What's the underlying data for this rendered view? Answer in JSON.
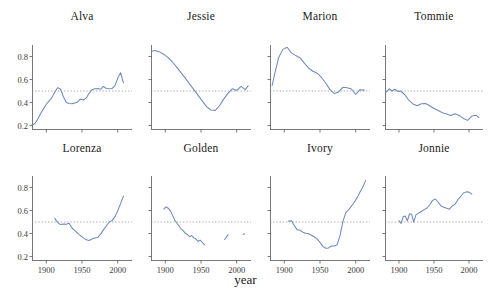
{
  "figure": {
    "xlabel": "year",
    "background": "#ffffff",
    "line_color": "#7089bd",
    "axis_color": "#555555",
    "reference_line_color": "#8c8c8c",
    "reference_line_value": 0.5
  },
  "chart_data": {
    "type": "line",
    "title": "",
    "xlabel": "year",
    "ylabel": "",
    "xlim": [
      1880,
      2020
    ],
    "ylim": [
      0.17,
      0.9
    ],
    "xticks": [
      1900,
      1950,
      2000
    ],
    "xtick_labels": [
      "1900",
      "1950",
      "2000"
    ],
    "yticks": [
      0.2,
      0.4,
      0.6,
      0.8
    ],
    "ytick_labels": [
      "0.2",
      "0.4",
      "0.6",
      "0.8"
    ],
    "grid": false,
    "legend": "none",
    "annotations": [
      {
        "type": "hline",
        "y": 0.5,
        "style": "dotted",
        "color": "#8c8c8c"
      }
    ],
    "facet_layout": {
      "rows": 2,
      "cols": 4
    },
    "facets": [
      {
        "name": "Alva",
        "row": 0,
        "col": 0,
        "ytick_labels_shown": true,
        "xtick_labels_shown": false,
        "x": [
          1880,
          1884,
          1888,
          1892,
          1896,
          1900,
          1904,
          1908,
          1912,
          1916,
          1920,
          1924,
          1928,
          1932,
          1936,
          1940,
          1944,
          1948,
          1952,
          1956,
          1960,
          1964,
          1968,
          1972,
          1976,
          1980,
          1984,
          1988,
          1992,
          1996,
          2000,
          2004,
          2008
        ],
        "y": [
          0.205,
          0.215,
          0.255,
          0.305,
          0.345,
          0.385,
          0.415,
          0.445,
          0.49,
          0.53,
          0.515,
          0.45,
          0.4,
          0.392,
          0.39,
          0.395,
          0.405,
          0.43,
          0.422,
          0.44,
          0.48,
          0.512,
          0.52,
          0.522,
          0.515,
          0.54,
          0.522,
          0.52,
          0.522,
          0.545,
          0.61,
          0.66,
          0.572
        ]
      },
      {
        "name": "Jessie",
        "row": 0,
        "col": 1,
        "ytick_labels_shown": false,
        "xtick_labels_shown": false,
        "x": [
          1881,
          1886,
          1892,
          1898,
          1904,
          1910,
          1916,
          1922,
          1928,
          1934,
          1940,
          1946,
          1952,
          1958,
          1964,
          1970,
          1976,
          1982,
          1988,
          1994,
          2000,
          2006,
          2012,
          2016
        ],
        "y": [
          0.845,
          0.852,
          0.84,
          0.818,
          0.79,
          0.752,
          0.708,
          0.66,
          0.612,
          0.562,
          0.512,
          0.462,
          0.412,
          0.362,
          0.335,
          0.332,
          0.372,
          0.432,
          0.482,
          0.52,
          0.505,
          0.54,
          0.512,
          0.545
        ]
      },
      {
        "name": "Marion",
        "row": 0,
        "col": 2,
        "ytick_labels_shown": false,
        "xtick_labels_shown": false,
        "x": [
          1883,
          1887,
          1892,
          1898,
          1904,
          1910,
          1916,
          1922,
          1928,
          1934,
          1940,
          1946,
          1952,
          1958,
          1964,
          1970,
          1976,
          1982,
          1988,
          1994,
          2000,
          2006,
          2012
        ],
        "y": [
          0.548,
          0.66,
          0.79,
          0.862,
          0.88,
          0.832,
          0.808,
          0.79,
          0.742,
          0.7,
          0.672,
          0.655,
          0.618,
          0.57,
          0.512,
          0.478,
          0.492,
          0.532,
          0.528,
          0.518,
          0.47,
          0.512,
          0.508
        ]
      },
      {
        "name": "Tommie",
        "row": 0,
        "col": 3,
        "ytick_labels_shown": false,
        "xtick_labels_shown": false,
        "x": [
          1882,
          1886,
          1890,
          1894,
          1898,
          1902,
          1908,
          1914,
          1920,
          1926,
          1932,
          1938,
          1944,
          1950,
          1956,
          1962,
          1968,
          1974,
          1980,
          1986,
          1992,
          1998,
          2004,
          2010,
          2014
        ],
        "y": [
          0.492,
          0.52,
          0.5,
          0.515,
          0.498,
          0.5,
          0.47,
          0.42,
          0.388,
          0.372,
          0.39,
          0.392,
          0.372,
          0.348,
          0.33,
          0.312,
          0.3,
          0.288,
          0.302,
          0.288,
          0.262,
          0.245,
          0.282,
          0.29,
          0.27
        ]
      },
      {
        "name": "Lorenza",
        "row": 1,
        "col": 0,
        "ytick_labels_shown": true,
        "xtick_labels_shown": true,
        "x": [
          1912,
          1916,
          1920,
          1924,
          1928,
          1932,
          1936,
          1940,
          1944,
          1948,
          1952,
          1956,
          1960,
          1964,
          1968,
          1972,
          1976,
          1980,
          1984,
          1988,
          1992,
          1996,
          2000,
          2004,
          2008
        ],
        "y": [
          0.532,
          0.495,
          0.478,
          0.482,
          0.48,
          0.49,
          0.448,
          0.425,
          0.402,
          0.382,
          0.362,
          0.345,
          0.34,
          0.352,
          0.362,
          0.365,
          0.395,
          0.432,
          0.465,
          0.5,
          0.512,
          0.545,
          0.598,
          0.66,
          0.725
        ]
      },
      {
        "name": "Golden",
        "row": 1,
        "col": 1,
        "ytick_labels_shown": false,
        "xtick_labels_shown": true,
        "segments": [
          {
            "x": [
              1898,
              1901,
              1904,
              1907,
              1910,
              1913,
              1916,
              1919,
              1922,
              1925,
              1928,
              1931,
              1934,
              1937,
              1940,
              1943,
              1946,
              1949,
              1952,
              1955
            ],
            "y": [
              0.612,
              0.632,
              0.62,
              0.6,
              0.56,
              0.52,
              0.492,
              0.468,
              0.44,
              0.425,
              0.402,
              0.392,
              0.372,
              0.382,
              0.362,
              0.352,
              0.332,
              0.342,
              0.322,
              0.302
            ]
          },
          {
            "x": [
              1983,
              1988
            ],
            "y": [
              0.348,
              0.39
            ]
          },
          {
            "x": [
              2009,
              2011
            ],
            "y": [
              0.392,
              0.398
            ]
          }
        ]
      },
      {
        "name": "Ivory",
        "row": 1,
        "col": 2,
        "ytick_labels_shown": false,
        "xtick_labels_shown": true,
        "x": [
          1906,
          1910,
          1914,
          1918,
          1922,
          1926,
          1930,
          1934,
          1938,
          1942,
          1946,
          1950,
          1954,
          1958,
          1962,
          1966,
          1970,
          1974,
          1978,
          1982,
          1986,
          1990,
          1994,
          1998,
          2002,
          2006,
          2010,
          2014
        ],
        "y": [
          0.508,
          0.512,
          0.47,
          0.432,
          0.428,
          0.412,
          0.402,
          0.398,
          0.385,
          0.372,
          0.352,
          0.322,
          0.288,
          0.272,
          0.275,
          0.292,
          0.292,
          0.302,
          0.382,
          0.502,
          0.582,
          0.605,
          0.638,
          0.672,
          0.712,
          0.76,
          0.805,
          0.862
        ]
      },
      {
        "name": "Jonnie",
        "row": 1,
        "col": 3,
        "ytick_labels_shown": false,
        "xtick_labels_shown": true,
        "x": [
          1900,
          1903,
          1906,
          1909,
          1912,
          1915,
          1918,
          1921,
          1924,
          1928,
          1932,
          1936,
          1940,
          1944,
          1948,
          1952,
          1956,
          1960,
          1964,
          1968,
          1972,
          1976,
          1980,
          1984,
          1988,
          1992,
          1996,
          2000,
          2004
        ],
        "y": [
          0.512,
          0.488,
          0.545,
          0.552,
          0.51,
          0.572,
          0.568,
          0.5,
          0.56,
          0.578,
          0.592,
          0.608,
          0.622,
          0.65,
          0.688,
          0.7,
          0.672,
          0.64,
          0.628,
          0.62,
          0.612,
          0.64,
          0.655,
          0.692,
          0.722,
          0.752,
          0.762,
          0.76,
          0.742
        ]
      }
    ]
  }
}
